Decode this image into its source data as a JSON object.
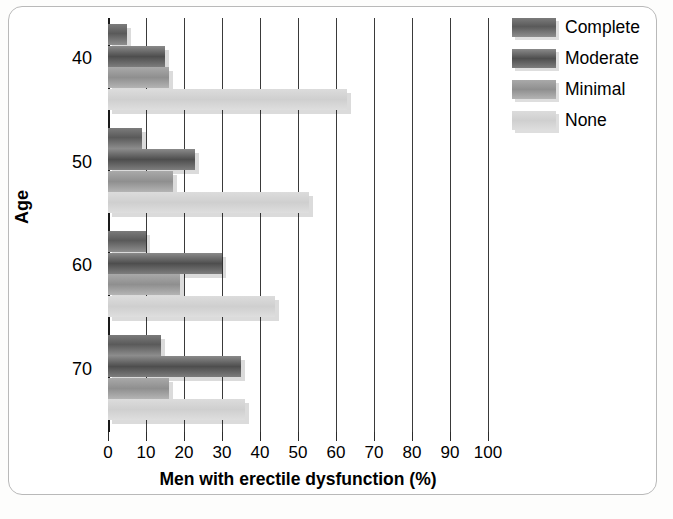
{
  "chart_data": {
    "type": "bar",
    "orientation": "horizontal",
    "title": "",
    "xlabel": "Men with erectile dysfunction (%)",
    "ylabel": "Age",
    "categories": [
      "40",
      "50",
      "60",
      "70"
    ],
    "xlim": [
      0,
      100
    ],
    "xticks": [
      "0",
      "10",
      "20",
      "30",
      "40",
      "50",
      "60",
      "70",
      "80",
      "90",
      "100"
    ],
    "grid": "vertical",
    "legend_position": "top-right",
    "series": [
      {
        "name": "Complete",
        "color": "#5a5a5a",
        "values": [
          5,
          9,
          10,
          14
        ]
      },
      {
        "name": "Moderate",
        "color": "#4e4e4e",
        "values": [
          15,
          23,
          30,
          35
        ]
      },
      {
        "name": "Minimal",
        "color": "#8f8f8f",
        "values": [
          16,
          17,
          19,
          16
        ]
      },
      {
        "name": "None",
        "color": "#cfcfcf",
        "values": [
          63,
          53,
          44,
          36
        ]
      }
    ]
  }
}
